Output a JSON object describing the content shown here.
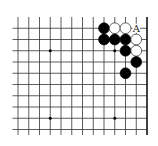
{
  "diagram": {
    "board_region": "top-right corner",
    "grid": {
      "columns": 13,
      "rows": 11,
      "origin_x": 18,
      "origin_y": 17,
      "col_spacing": 10.75,
      "row_spacing": 11.25,
      "line_color": "#333333",
      "edge_color": "#111111",
      "top_edge": true,
      "right_edge": true,
      "extends_left": true,
      "extends_bottom": true
    },
    "star_points": [
      {
        "col": 3,
        "row": 3
      },
      {
        "col": 9,
        "row": 3
      },
      {
        "col": 3,
        "row": 9
      },
      {
        "col": 9,
        "row": 9
      }
    ],
    "stones": [
      {
        "color": "black",
        "col": 8,
        "row": 1
      },
      {
        "color": "white",
        "col": 9,
        "row": 1
      },
      {
        "color": "white",
        "col": 10,
        "row": 1
      },
      {
        "color": "black",
        "col": 8,
        "row": 2
      },
      {
        "color": "black",
        "col": 9,
        "row": 2
      },
      {
        "color": "black",
        "col": 10,
        "row": 2
      },
      {
        "color": "white",
        "col": 11,
        "row": 2
      },
      {
        "color": "black",
        "col": 10,
        "row": 3
      },
      {
        "color": "white",
        "col": 11,
        "row": 3
      },
      {
        "color": "black",
        "col": 11,
        "row": 4
      },
      {
        "color": "black",
        "col": 10,
        "row": 5
      }
    ],
    "labels": [
      {
        "text": "A",
        "col": 11,
        "row": 1
      }
    ],
    "colors": {
      "black_stone": "#000000",
      "white_stone": "#ffffff",
      "white_stone_outline": "#222222",
      "background": "#ffffff"
    }
  }
}
